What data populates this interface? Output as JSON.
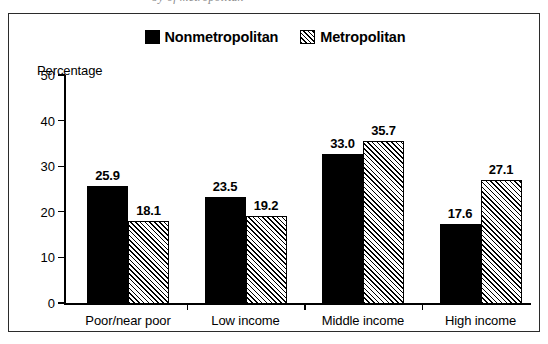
{
  "caption": {
    "clipped_text": "by of metropolitan"
  },
  "chart_data": {
    "type": "bar",
    "title": "",
    "xlabel": "",
    "ylabel": "Percentage",
    "ylim": [
      0,
      50
    ],
    "yticks": [
      0,
      10,
      20,
      30,
      40,
      50
    ],
    "ytick_labels": [
      "0",
      "10",
      "20",
      "30",
      "40",
      "50"
    ],
    "grid": false,
    "legend_position": "top-center",
    "categories": [
      "Poor/near poor",
      "Low income",
      "Middle income",
      "High income"
    ],
    "series": [
      {
        "name": "Nonmetropolitan",
        "fill": "solid-black",
        "color": "#000000",
        "values": [
          25.9,
          23.5,
          33.0,
          17.6
        ],
        "value_labels": [
          "25.9",
          "23.5",
          "33.0",
          "17.6"
        ]
      },
      {
        "name": "Metropolitan",
        "fill": "diagonal-hatch",
        "color": "#000000",
        "values": [
          18.1,
          19.2,
          35.7,
          27.1
        ],
        "value_labels": [
          "18.1",
          "19.2",
          "35.7",
          "27.1"
        ]
      }
    ]
  },
  "colors": {
    "frame": "#2b2b2b",
    "axis": "#000000",
    "background": "#ffffff",
    "nonmetropolitan": "#000000",
    "metropolitan_hatch": "#000000"
  }
}
